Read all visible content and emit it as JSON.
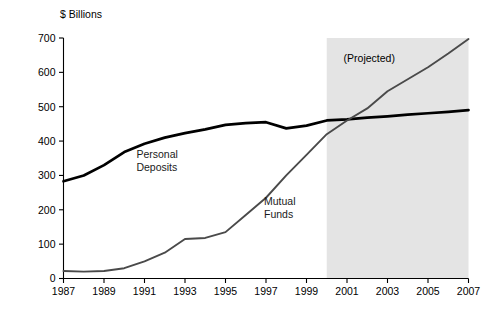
{
  "chart_data": {
    "type": "line",
    "title": "",
    "subtitle": "",
    "xlabel": "",
    "ylabel": "$ Billions",
    "xlim": [
      1987,
      2007
    ],
    "ylim": [
      0,
      700
    ],
    "grid": false,
    "legend_position": "inline-labels",
    "x_tick_labels": [
      "1987",
      "1989",
      "1991",
      "1993",
      "1995",
      "1997",
      "1999",
      "2001",
      "2003",
      "2005",
      "2007"
    ],
    "x_tick_values": [
      1987,
      1989,
      1991,
      1993,
      1995,
      1997,
      1999,
      2001,
      2003,
      2005,
      2007
    ],
    "y_tick_labels": [
      "0",
      "100",
      "200",
      "300",
      "400",
      "500",
      "600",
      "700"
    ],
    "y_tick_values": [
      0,
      100,
      200,
      300,
      400,
      500,
      600,
      700
    ],
    "x": [
      1987,
      1988,
      1989,
      1990,
      1991,
      1992,
      1993,
      1994,
      1995,
      1996,
      1997,
      1998,
      1999,
      2000,
      2001,
      2002,
      2003,
      2004,
      2005,
      2006,
      2007
    ],
    "series": [
      {
        "name": "Personal Deposits",
        "color": "#000000",
        "label_x": 1990.6,
        "label_y": 352,
        "values": [
          283,
          300,
          330,
          368,
          392,
          410,
          423,
          434,
          447,
          452,
          455,
          437,
          445,
          460,
          463,
          468,
          472,
          477,
          481,
          485,
          490
        ]
      },
      {
        "name": "Mutual Funds",
        "color": "#4a4a4a",
        "label_x": 1996.9,
        "label_y": 215,
        "values": [
          22,
          20,
          22,
          30,
          50,
          75,
          115,
          118,
          135,
          185,
          235,
          300,
          360,
          420,
          460,
          495,
          545,
          580,
          615,
          655,
          697
        ]
      }
    ],
    "annotations": [
      {
        "name": "projected-label",
        "text": "(Projected)",
        "x": 2002.1,
        "y": 630
      }
    ],
    "shaded_regions": [
      {
        "name": "projected-band",
        "x_start": 2000,
        "x_end": 2007,
        "y_start": 0,
        "y_end": 700,
        "color": "#e4e4e4"
      }
    ]
  }
}
